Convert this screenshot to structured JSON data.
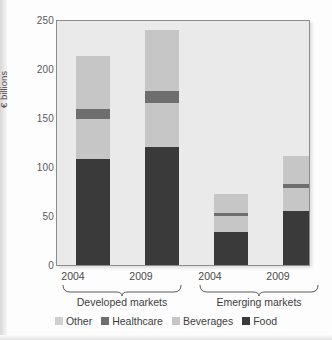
{
  "chart_data": {
    "type": "bar",
    "stacked": true,
    "title": "",
    "xlabel": "",
    "ylabel": "€ billions",
    "ylim": [
      0,
      250
    ],
    "yticks": [
      0,
      50,
      100,
      150,
      200,
      250
    ],
    "grid": false,
    "legend_position": "bottom",
    "categories": [
      "2004",
      "2009",
      "2004",
      "2009"
    ],
    "groups": [
      {
        "label": "Developed markets",
        "categories": [
          "2004",
          "2009"
        ]
      },
      {
        "label": "Emerging markets",
        "categories": [
          "2004",
          "2009"
        ]
      }
    ],
    "series": [
      {
        "name": "Food",
        "color": "#3a3a3a",
        "values": [
          108,
          120,
          34,
          55
        ]
      },
      {
        "name": "Beverages",
        "color": "#c6c6c6",
        "values": [
          40,
          45,
          16,
          23
        ]
      },
      {
        "name": "Healthcare",
        "color": "#6e6e6e",
        "values": [
          11,
          12,
          3,
          4
        ]
      },
      {
        "name": "Other",
        "color": "#c6c6c6",
        "values": [
          53,
          62,
          19,
          29
        ]
      }
    ],
    "totals": [
      212,
      239,
      72,
      111
    ],
    "legend": [
      {
        "label": "Other",
        "color": "#cfcfcf"
      },
      {
        "label": "Healthcare",
        "color": "#6e6e6e"
      },
      {
        "label": "Beverages",
        "color": "#c6c6c6"
      },
      {
        "label": "Food",
        "color": "#3a3a3a"
      }
    ]
  },
  "axis": {
    "y_label": "€ billions",
    "y_ticks": [
      "250",
      "200",
      "150",
      "100",
      "50",
      "0"
    ],
    "x_ticks": [
      "2004",
      "2009",
      "2004",
      "2009"
    ]
  },
  "groups": {
    "developed": "Developed markets",
    "emerging": "Emerging markets"
  },
  "colors": {
    "food": "#3a3a3a",
    "beverages": "#c6c6c6",
    "healthcare": "#6e6e6e",
    "other": "#cfcfcf",
    "plot_background": "#eaeaea",
    "plot_border": "#8d8d8d"
  }
}
